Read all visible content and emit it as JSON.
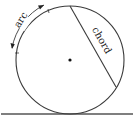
{
  "diagram": {
    "labels": {
      "arc": "arc",
      "chord": "chord"
    },
    "colors": {
      "stroke": "#3a3a3a",
      "background": "#ffffff"
    },
    "elements": [
      "circle",
      "center-point",
      "chord",
      "arc-annotation",
      "tangent-ground-line"
    ]
  }
}
